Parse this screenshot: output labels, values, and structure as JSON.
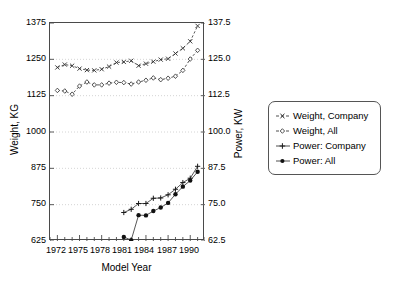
{
  "chart_data": {
    "type": "line",
    "title": "",
    "xlabel": "Model Year",
    "ylabel": "Weight, KG",
    "y2label": "Power, KW",
    "xlim": [
      1971,
      1992
    ],
    "ylim": [
      625,
      1375
    ],
    "y2lim": [
      62.5,
      137.5
    ],
    "grid": true,
    "legend_position": "right-outside",
    "x_ticks_major": [
      1972,
      1975,
      1978,
      1981,
      1984,
      1987,
      1990
    ],
    "x_ticks_minor_step": 1,
    "y_ticks_left": [
      625,
      750,
      875,
      1000,
      1125,
      1250,
      1375
    ],
    "y_ticks_right": [
      62.5,
      75.0,
      87.5,
      100.0,
      112.5,
      125.0,
      137.5
    ],
    "series": [
      {
        "name": "Weight, Company",
        "axis": "left",
        "marker": "x",
        "line": "dashed",
        "x": [
          1972,
          1973,
          1974,
          1975,
          1976,
          1977,
          1978,
          1979,
          1980,
          1981,
          1982,
          1983,
          1984,
          1985,
          1986,
          1987,
          1988,
          1989,
          1990,
          1991
        ],
        "values": [
          1222,
          1232,
          1228,
          1218,
          1213,
          1212,
          1216,
          1225,
          1239,
          1241,
          1245,
          1228,
          1235,
          1242,
          1249,
          1252,
          1270,
          1288,
          1312,
          1365
        ]
      },
      {
        "name": "Weight, All",
        "axis": "left",
        "marker": "diamond-open",
        "line": "dashed",
        "x": [
          1972,
          1973,
          1974,
          1975,
          1976,
          1977,
          1978,
          1979,
          1980,
          1981,
          1982,
          1983,
          1984,
          1985,
          1986,
          1987,
          1988,
          1989,
          1990,
          1991
        ],
        "values": [
          1143,
          1141,
          1130,
          1158,
          1172,
          1162,
          1162,
          1168,
          1171,
          1170,
          1165,
          1172,
          1178,
          1186,
          1180,
          1185,
          1192,
          1212,
          1251,
          1281
        ]
      },
      {
        "name": "Power: Company",
        "axis": "right",
        "marker": "plus",
        "line": "solid",
        "x": [
          1981,
          1982,
          1983,
          1984,
          1985,
          1986,
          1987,
          1988,
          1989,
          1990,
          1991
        ],
        "values": [
          72.3,
          73.4,
          75.4,
          75.4,
          77.2,
          77.3,
          78.4,
          80.3,
          82.6,
          84.1,
          88.2
        ]
      },
      {
        "name": "Power: All",
        "axis": "right",
        "marker": "circle-filled",
        "line": "solid",
        "x": [
          1981,
          1982,
          1983,
          1984,
          1985,
          1986,
          1987,
          1988,
          1989,
          1990,
          1991
        ],
        "values": [
          63.9,
          62.8,
          71.4,
          71.3,
          72.8,
          74.0,
          75.6,
          78.6,
          81.2,
          83.3,
          86.3
        ]
      }
    ]
  },
  "axes": {
    "left_title": "Weight, KG",
    "right_title": "Power, KW",
    "x_title": "Model  Year",
    "left_ticks": [
      "1375",
      "1250",
      "1125",
      "1000",
      "875",
      "750",
      "625"
    ],
    "right_ticks": [
      "137.5",
      "125.0",
      "112.5",
      "100.0",
      "87.5",
      "75.0",
      "62.5"
    ],
    "x_ticks": [
      "1972",
      "1975",
      "1978",
      "1981",
      "1984",
      "1987",
      "1990"
    ]
  },
  "legend": {
    "items": [
      {
        "label": "Weight,  Company",
        "marker": "x-marker-icon"
      },
      {
        "label": "Weight,  All",
        "marker": "diamond-marker-icon"
      },
      {
        "label": "Power:  Company",
        "marker": "plus-marker-icon"
      },
      {
        "label": "Power:  All",
        "marker": "circle-marker-icon"
      }
    ]
  },
  "colors": {
    "line": "#3a3a3a",
    "frame": "#4a4a4a",
    "grid": "#c9c9c9",
    "text": "#000000",
    "background": "#ffffff"
  }
}
